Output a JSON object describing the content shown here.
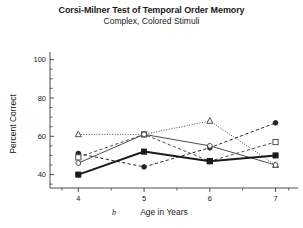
{
  "chart_data": {
    "type": "line",
    "title": "Corsi-Milner Test of Temporal Order Memory",
    "subtitle": "Complex, Colored Stimuli",
    "panel_letter": "b",
    "xlabel": "Age in Years",
    "ylabel": "Percent Correct",
    "x": [
      4,
      5,
      6,
      7
    ],
    "xticklabels": [
      "4",
      "5",
      "6",
      "7"
    ],
    "yticklabels": [
      "40",
      "60",
      "80",
      "100"
    ],
    "yticks": [
      40,
      60,
      80,
      100
    ],
    "xlim": [
      3.6,
      7.25
    ],
    "ylim": [
      33,
      104
    ],
    "grid": false,
    "legend": "none",
    "minor_ticks": true,
    "series": [
      {
        "name": "open-triangle",
        "marker": "triangle-open",
        "linestyle": "dotted",
        "linewidth": 1,
        "color": "#4d4d4d",
        "values": [
          61,
          61,
          68,
          45
        ]
      },
      {
        "name": "filled-circle",
        "marker": "circle-filled",
        "linestyle": "dashed",
        "linewidth": 1,
        "color": "#262626",
        "values": [
          51,
          44,
          54,
          67
        ]
      },
      {
        "name": "open-square",
        "marker": "square-open",
        "linestyle": "dashed",
        "linewidth": 1,
        "color": "#4d4d4d",
        "values": [
          49,
          61,
          47,
          57
        ]
      },
      {
        "name": "open-circle",
        "marker": "circle-open",
        "linestyle": "solid",
        "linewidth": 1,
        "color": "#4d4d4d",
        "values": [
          46,
          61,
          55,
          45
        ]
      },
      {
        "name": "filled-square",
        "marker": "square-filled",
        "linestyle": "solid",
        "linewidth": 2,
        "color": "#1a1a1a",
        "values": [
          40,
          52,
          47,
          50
        ]
      }
    ]
  }
}
